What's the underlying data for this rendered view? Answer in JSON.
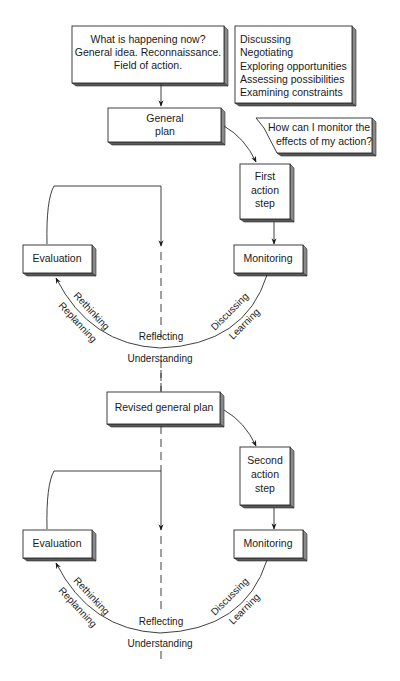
{
  "diagram": {
    "intro_box": {
      "lines": [
        "What is happening now?",
        "General idea. Reconnaissance.",
        "Field of action."
      ]
    },
    "activities_box": {
      "lines": [
        "Discussing",
        "Negotiating",
        "Exploring opportunities",
        "Assessing possibilities",
        "Examining constraints"
      ]
    },
    "question_bubble": {
      "lines": [
        "How can I monitor the",
        "effects of my action?"
      ]
    },
    "cycle1": {
      "plan": {
        "lines": [
          "General",
          "plan"
        ]
      },
      "action": {
        "lines": [
          "First",
          "action",
          "step"
        ]
      },
      "monitoring": "Monitoring",
      "evaluation": "Evaluation",
      "arc_labels": {
        "rethinking": "Rethinking",
        "replanning": "Replanning",
        "reflecting": "Reflecting",
        "understanding": "Understanding",
        "discussing": "Discussing",
        "learning": "Learning"
      }
    },
    "cycle2": {
      "plan": {
        "lines": [
          "Revised general plan"
        ]
      },
      "action": {
        "lines": [
          "Second",
          "action",
          "step"
        ]
      },
      "monitoring": "Monitoring",
      "evaluation": "Evaluation",
      "arc_labels": {
        "rethinking": "Rethinking",
        "replanning": "Replanning",
        "reflecting": "Reflecting",
        "understanding": "Understanding",
        "discussing": "Discussing",
        "learning": "Learning"
      }
    }
  }
}
